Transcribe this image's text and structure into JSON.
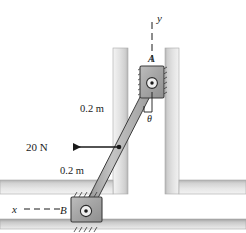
{
  "figure": {
    "labels": {
      "axis_y": "y",
      "axis_x": "x",
      "collar_a": "A",
      "collar_b": "B",
      "angle_theta": "θ",
      "dim_upper": "0.2 m",
      "dim_lower": "0.2 m",
      "force": "20 N"
    },
    "colors": {
      "wall_fill": "#c9c9c9",
      "wall_edge": "#8a8a8a",
      "collar_fill": "#a8a8a8",
      "collar_edge": "#4a4a4a",
      "rod_fill": "#b0b0b0",
      "rod_edge": "#3d3d3d",
      "line": "#1a1a1a",
      "background": "#ffffff"
    },
    "geometry": {
      "pin_a": [
        152,
        83
      ],
      "pin_b": [
        86,
        212
      ],
      "force_application": [
        119,
        147
      ],
      "force_direction": "left",
      "rod_length_segments": [
        "0.2 m",
        "0.2 m"
      ]
    }
  }
}
